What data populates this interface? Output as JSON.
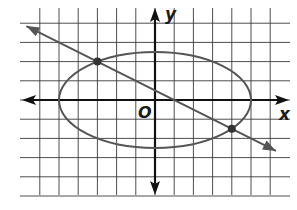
{
  "chart_data": {
    "type": "diagram",
    "title": "",
    "axes": {
      "x_label": "x",
      "y_label": "y",
      "origin_label": "O",
      "unit_px": 19.2,
      "origin_px": [
        155,
        100
      ],
      "grid": true,
      "x_grid_range": [
        -6,
        6
      ],
      "y_grid_range": [
        -5,
        4
      ]
    },
    "curves": [
      {
        "name": "ellipse",
        "equation": "x^2/25 + y^2/6.25 = 1",
        "center": [
          0,
          0
        ],
        "semi_major_x": 5,
        "semi_minor_y": 2.5,
        "color": "#555555"
      },
      {
        "name": "line",
        "equation": "y = -0.5x + 0.5",
        "slope": -0.5,
        "intercept": 0.5,
        "arrows": "both",
        "color": "#555555"
      }
    ],
    "points": [
      {
        "name": "intersection-1",
        "x": -3,
        "y": 2
      },
      {
        "name": "intersection-2",
        "x": 4,
        "y": -1.5
      }
    ]
  },
  "labels": {
    "x": "x",
    "y": "y",
    "origin": "O"
  },
  "colors": {
    "grid": "#333333",
    "axis": "#111111",
    "curve": "#555555",
    "point": "#333333"
  }
}
